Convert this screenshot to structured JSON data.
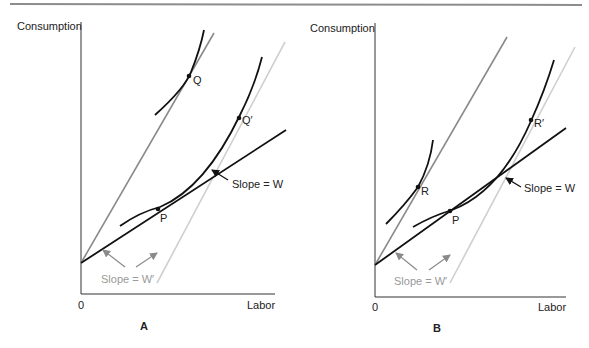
{
  "figure": {
    "panels": [
      {
        "id": "A",
        "panel_label": "A",
        "y_axis_label": "Consumption",
        "x_axis_label": "Labor",
        "origin_label": "0",
        "points": {
          "upper": "Q",
          "upper_right": "Q′",
          "tangent": "P"
        },
        "annotations": {
          "slope_w": "Slope = W",
          "slope_w_prime": "Slope = W′"
        }
      },
      {
        "id": "B",
        "panel_label": "B",
        "y_axis_label": "Consumption",
        "x_axis_label": "Labor",
        "origin_label": "0",
        "points": {
          "upper": "R",
          "upper_right": "R′",
          "tangent": "P"
        },
        "annotations": {
          "slope_w": "Slope = W",
          "slope_w_prime": "Slope = W′"
        }
      }
    ],
    "colors": {
      "black_line": "#111111",
      "gray_line": "#8a8a8a",
      "light_gray_line": "#cfcfcf",
      "header_rule": "#8c8c8c"
    }
  }
}
